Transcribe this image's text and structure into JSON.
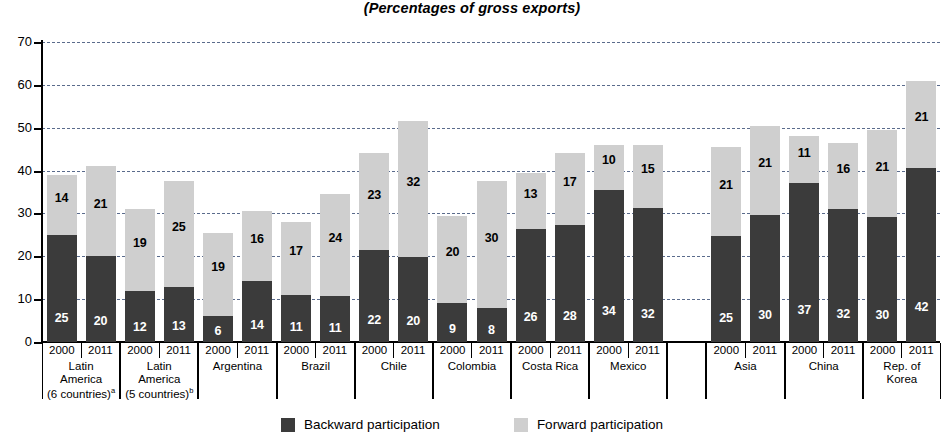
{
  "chart_data": {
    "type": "bar",
    "subtype": "stacked",
    "title": "",
    "subtitle": "(Percentages of gross exports)",
    "xlabel": "",
    "ylabel": "",
    "ylim": [
      0,
      70
    ],
    "ytick_step": 10,
    "yticks": [
      "0",
      "10",
      "20",
      "30",
      "40",
      "50",
      "60",
      "70"
    ],
    "grid": true,
    "legend_position": "bottom-center",
    "series": [
      {
        "name": "Backward participation",
        "color": "#3b3b3b",
        "values": [
          25,
          20,
          12,
          13,
          6,
          14,
          11,
          11,
          22,
          20,
          9,
          8,
          26,
          28,
          34,
          32,
          25,
          30,
          37,
          32,
          30,
          42
        ]
      },
      {
        "name": "Forward participation",
        "color": "#cfcfcf",
        "values": [
          14,
          21,
          19,
          25,
          19,
          16,
          17,
          24,
          23,
          32,
          20,
          30,
          13,
          17,
          10,
          15,
          21,
          21,
          11,
          16,
          21,
          21
        ]
      }
    ],
    "bar_totals": [
      39,
      41,
      31,
      37.5,
      25.5,
      30.5,
      28,
      34.5,
      44,
      51.5,
      29.5,
      37.5,
      39.5,
      44,
      46,
      46,
      45.5,
      50.5,
      48,
      46.5,
      49.5,
      61
    ],
    "categories": [
      "Latin America (6 countries)a 2000",
      "Latin America (6 countries)a 2011",
      "Latin America (5 countries)b 2000",
      "Latin America (5 countries)b 2011",
      "Argentina 2000",
      "Argentina 2011",
      "Brazil 2000",
      "Brazil 2011",
      "Chile 2000",
      "Chile 2011",
      "Colombia 2000",
      "Colombia 2011",
      "Costa Rica 2000",
      "Costa Rica 2011",
      "Mexico 2000",
      "Mexico 2011",
      "Asia 2000",
      "Asia 2011",
      "China 2000",
      "China 2011",
      "Rep. of Korea 2000",
      "Rep. of Korea 2011"
    ],
    "groups": [
      {
        "name": "Latin\nAmerica\n(6 countries)",
        "footnote": "a",
        "years": [
          "2000",
          "2011"
        ],
        "bars": [
          {
            "back": 25,
            "fwd": 14,
            "total": 39
          },
          {
            "back": 20,
            "fwd": 21,
            "total": 41
          }
        ]
      },
      {
        "name": "Latin\nAmerica\n(5 countries)",
        "footnote": "b",
        "years": [
          "2000",
          "2011"
        ],
        "bars": [
          {
            "back": 12,
            "fwd": 19,
            "total": 31
          },
          {
            "back": 13,
            "fwd": 25,
            "total": 37.5
          }
        ]
      },
      {
        "name": "Argentina",
        "footnote": "",
        "years": [
          "2000",
          "2011"
        ],
        "bars": [
          {
            "back": 6,
            "fwd": 19,
            "total": 25.5
          },
          {
            "back": 14,
            "fwd": 16,
            "total": 30.5
          }
        ]
      },
      {
        "name": "Brazil",
        "footnote": "",
        "years": [
          "2000",
          "2011"
        ],
        "bars": [
          {
            "back": 11,
            "fwd": 17,
            "total": 28
          },
          {
            "back": 11,
            "fwd": 24,
            "total": 34.5
          }
        ]
      },
      {
        "name": "Chile",
        "footnote": "",
        "years": [
          "2000",
          "2011"
        ],
        "bars": [
          {
            "back": 22,
            "fwd": 23,
            "total": 44
          },
          {
            "back": 20,
            "fwd": 32,
            "total": 51.5
          }
        ]
      },
      {
        "name": "Colombia",
        "footnote": "",
        "years": [
          "2000",
          "2011"
        ],
        "bars": [
          {
            "back": 9,
            "fwd": 20,
            "total": 29.5
          },
          {
            "back": 8,
            "fwd": 30,
            "total": 37.5
          }
        ]
      },
      {
        "name": "Costa Rica",
        "footnote": "",
        "years": [
          "2000",
          "2011"
        ],
        "bars": [
          {
            "back": 26,
            "fwd": 13,
            "total": 39.5
          },
          {
            "back": 28,
            "fwd": 17,
            "total": 44
          }
        ]
      },
      {
        "name": "Mexico",
        "footnote": "",
        "years": [
          "2000",
          "2011"
        ],
        "bars": [
          {
            "back": 34,
            "fwd": 10,
            "total": 46
          },
          {
            "back": 32,
            "fwd": 15,
            "total": 46
          }
        ]
      },
      {
        "name": "",
        "footnote": "",
        "years": [
          "",
          ""
        ],
        "spacer": true,
        "bars": []
      },
      {
        "name": "Asia",
        "footnote": "",
        "years": [
          "2000",
          "2011"
        ],
        "bars": [
          {
            "back": 25,
            "fwd": 21,
            "total": 45.5
          },
          {
            "back": 30,
            "fwd": 21,
            "total": 50.5
          }
        ]
      },
      {
        "name": "China",
        "footnote": "",
        "years": [
          "2000",
          "2011"
        ],
        "bars": [
          {
            "back": 37,
            "fwd": 11,
            "total": 48
          },
          {
            "back": 32,
            "fwd": 16,
            "total": 46.5
          }
        ]
      },
      {
        "name": "Rep. of\nKorea",
        "footnote": "",
        "years": [
          "2000",
          "2011"
        ],
        "bars": [
          {
            "back": 30,
            "fwd": 21,
            "total": 49.5
          },
          {
            "back": 42,
            "fwd": 21,
            "total": 61
          }
        ]
      }
    ]
  },
  "legend": {
    "items": [
      {
        "label": "Backward participation",
        "swatch": "back"
      },
      {
        "label": "Forward participation",
        "swatch": "fwd"
      }
    ]
  },
  "colors": {
    "backward": "#3b3b3b",
    "forward": "#cfcfcf",
    "grid": "#5a6b8c",
    "axis": "#000000"
  }
}
